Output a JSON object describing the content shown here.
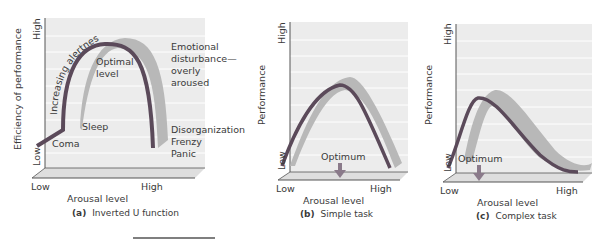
{
  "colors": {
    "panel_bg": "#ececec",
    "floor": "#dedede",
    "gridline": "#ffffff",
    "curve": "#5b4a5a",
    "band": "#b8b8b8",
    "axis": "#555555",
    "text": "#3a3a3a"
  },
  "panels": [
    {
      "id": "a",
      "caption_letter": "(a)",
      "caption_text": "Inverted U function",
      "y_axis_label": "Efficiency of performance",
      "y_high": "High",
      "y_low": "Low",
      "x_low": "Low",
      "x_high": "High",
      "x_axis_label": "Arousal level",
      "annotations": {
        "increasing": "Increasing alertness",
        "optimal_1": "Optimal",
        "optimal_2": "level",
        "sleep": "Sleep",
        "coma": "Coma",
        "emotional_1": "Emotional",
        "emotional_2": "disturbance—",
        "emotional_3": "overly",
        "emotional_4": "aroused",
        "disorg_1": "Disorganization",
        "disorg_2": "Frenzy",
        "disorg_3": "Panic"
      }
    },
    {
      "id": "b",
      "caption_letter": "(b)",
      "caption_text": "Simple task",
      "y_axis_label": "Performance",
      "y_high": "High",
      "y_low": "Low",
      "x_low": "Low",
      "x_high": "High",
      "x_axis_label": "Arousal level",
      "optimum_label": "Optimum"
    },
    {
      "id": "c",
      "caption_letter": "(c)",
      "caption_text": "Complex task",
      "y_axis_label": "Performance",
      "y_high": "High",
      "y_low": "Low",
      "x_low": "Low",
      "x_high": "High",
      "x_axis_label": "Arousal level",
      "optimum_label": "Optimum"
    }
  ]
}
